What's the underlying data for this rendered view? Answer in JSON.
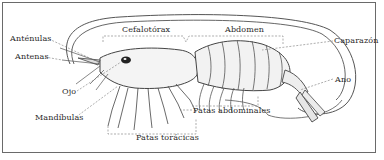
{
  "diagram": {
    "frame_color": "#6a6a6a",
    "line_color": "#3a3a3a",
    "labels": {
      "cefalotorax": "Cefalotórax",
      "abdomen": "Abdomen",
      "caparazon": "Caparazón",
      "ano": "Ano",
      "antenulas": "Anténulas",
      "antenas": "Antenas",
      "ojo": "Ojo",
      "mandibulas": "Mandíbulas",
      "patas_abdominales": "Patas abdominales",
      "patas_toracicas": "Patas torácicas"
    }
  }
}
